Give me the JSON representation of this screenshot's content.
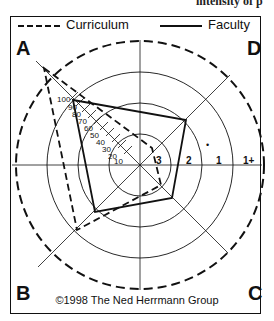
{
  "page_fragment": "intensity of p",
  "legend": {
    "curriculum": {
      "label": "Curriculum",
      "style": "dashed"
    },
    "faculty": {
      "label": "Faculty",
      "style": "solid"
    }
  },
  "quadrants": {
    "top_left": "A",
    "top_right": "D",
    "bottom_left": "B",
    "bottom_right": "C"
  },
  "scale": {
    "diagonal_ticks": [
      "100",
      "90",
      "80",
      "70",
      "60",
      "50",
      "40",
      "30",
      "20",
      "10"
    ],
    "ring_labels": [
      "3",
      "2",
      "1",
      "1+"
    ],
    "marker": "•"
  },
  "copyright": "©1998 The Ned Herrmann Group",
  "colors": {
    "ink": "#111111",
    "background": "#ffffff"
  }
}
